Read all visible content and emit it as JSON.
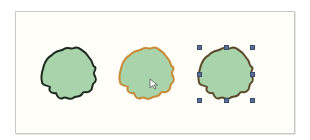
{
  "canvas": {
    "background": "#fffef9",
    "border": "#c9c9c4"
  },
  "shapes": [
    {
      "name": "shape-default",
      "state": "default",
      "fill": "#a9d3ab",
      "stroke": "#1e2a1f"
    },
    {
      "name": "shape-hover",
      "state": "hover",
      "fill": "#a9d3ab",
      "stroke": "#c98a36"
    },
    {
      "name": "shape-selected",
      "state": "selected",
      "fill": "#a9d3ab",
      "stroke": "#5c4a2a"
    }
  ],
  "selection": {
    "handle_color": "#5a6f96",
    "handle_count": 8
  },
  "cursor": {
    "icon": "pointer-arrow-icon"
  }
}
